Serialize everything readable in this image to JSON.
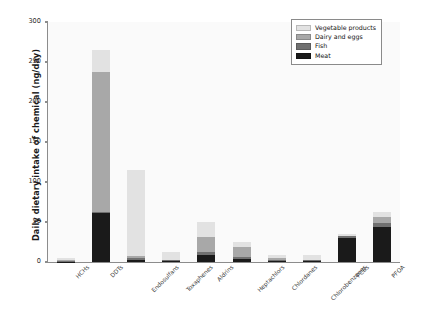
{
  "chart_data": {
    "type": "bar",
    "subtype": "stacked-vertical",
    "title": "",
    "xlabel": "",
    "ylabel": "Daily dietary intake of chemical (ng/day)",
    "ylim": [
      0,
      300
    ],
    "yticks": [
      0,
      50,
      100,
      150,
      200,
      250,
      300
    ],
    "ytick_labels": [
      "0",
      "50",
      "100",
      "150",
      "200",
      "250",
      "300"
    ],
    "grid": false,
    "legend_position": "top-right",
    "categories": [
      "HCHs",
      "DDTs",
      "Endosulfans",
      "Toxaphenes",
      "Aldrins",
      "Heptachlors",
      "Chlordanes",
      "Chlorobenzenes",
      "PCBs",
      "PFOA"
    ],
    "series": [
      {
        "name": "Meat",
        "color": "#1a1a1a",
        "values": [
          0.5,
          61,
          3,
          1,
          9,
          4,
          1.5,
          1,
          30,
          44
        ]
      },
      {
        "name": "Fish",
        "color": "#707070",
        "values": [
          1,
          2,
          2,
          1,
          3,
          2,
          1,
          1,
          2,
          5
        ]
      },
      {
        "name": "Dairy and eggs",
        "color": "#a8a8a8",
        "values": [
          1,
          175,
          2,
          1,
          19,
          13,
          2,
          1,
          1,
          7
        ]
      },
      {
        "name": "Vegetable products",
        "color": "#e2e2e2",
        "values": [
          2,
          27,
          108,
          10,
          19,
          6,
          4,
          6,
          2,
          7
        ]
      }
    ],
    "totals": [
      4.5,
      265,
      115,
      13,
      50,
      25,
      8.5,
      9,
      35,
      63
    ]
  },
  "legend": {
    "items": [
      {
        "label": "Vegetable products",
        "color": "#e2e2e2"
      },
      {
        "label": "Dairy and eggs",
        "color": "#a8a8a8"
      },
      {
        "label": "Fish",
        "color": "#707070"
      },
      {
        "label": "Meat",
        "color": "#1a1a1a"
      }
    ]
  }
}
